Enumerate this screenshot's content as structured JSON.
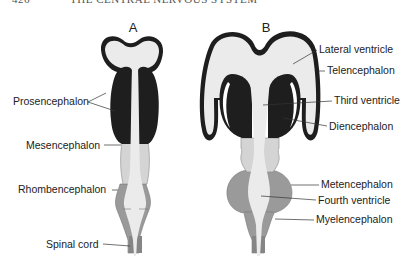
{
  "header": {
    "page_number": "426",
    "running_title": "THE CENTRAL NERVOUS SYSTEM"
  },
  "panels": [
    {
      "id": "A",
      "label": "A",
      "annotations": [
        {
          "text": "Prosencephalon"
        },
        {
          "text": "Mesencephalon"
        },
        {
          "text": "Rhombencephalon"
        },
        {
          "text": "Spinal cord"
        }
      ]
    },
    {
      "id": "B",
      "label": "B",
      "annotations": [
        {
          "text": "Lateral ventricle"
        },
        {
          "text": "Telencephalon"
        },
        {
          "text": "Third ventricle"
        },
        {
          "text": "Diencephalon"
        },
        {
          "text": "Metencephalon"
        },
        {
          "text": "Fourth ventricle"
        },
        {
          "text": "Myelencephalon"
        }
      ]
    }
  ],
  "colors": {
    "dark": "#1e1e1e",
    "ventricle": "#ebebeb",
    "mid_gray": "#cfcfcf",
    "hind_gray": "#9a9a9a",
    "cord_gray": "#8a8a8a",
    "text": "#222222"
  }
}
